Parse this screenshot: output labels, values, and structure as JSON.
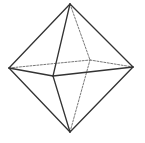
{
  "diagram": {
    "stroke_color": "#333333",
    "dashed_color": "#555555",
    "vertices": {
      "top": [
        70,
        4
      ],
      "bottom": [
        70,
        132
      ],
      "left": [
        9,
        68
      ],
      "right": [
        133,
        67
      ],
      "front": [
        53,
        76
      ],
      "back": [
        90,
        60
      ]
    },
    "solid_edges": [
      [
        "top",
        "left"
      ],
      [
        "top",
        "right"
      ],
      [
        "top",
        "front"
      ],
      [
        "bottom",
        "left"
      ],
      [
        "bottom",
        "right"
      ],
      [
        "bottom",
        "front"
      ],
      [
        "left",
        "front"
      ],
      [
        "front",
        "right"
      ]
    ],
    "dashed_edges": [
      [
        "top",
        "back"
      ],
      [
        "bottom",
        "back"
      ],
      [
        "left",
        "back"
      ],
      [
        "back",
        "right"
      ]
    ]
  }
}
